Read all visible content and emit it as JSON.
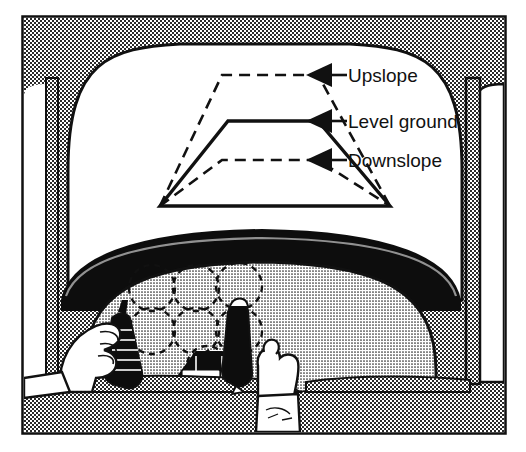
{
  "figure": {
    "frame_color": "#111111",
    "interior_fill_color": "#b4b4b4",
    "windshield_color": "#ffffff",
    "line_color": "#111111"
  },
  "callouts": [
    {
      "id": "upslope",
      "label": "Upslope",
      "style": "dashed",
      "arrow": "left-triangle",
      "arrow_x": 318,
      "arrow_y": 75,
      "text_x": 348,
      "text_y": 82,
      "leader_from_x": 328,
      "leader_to_x": 345
    },
    {
      "id": "level-ground",
      "label": "Level ground",
      "style": "solid",
      "arrow": "left-triangle",
      "arrow_x": 318,
      "arrow_y": 121,
      "text_x": 348,
      "text_y": 128,
      "leader_from_x": 328,
      "leader_to_x": 345
    },
    {
      "id": "downslope",
      "label": "Downslope",
      "style": "dashed",
      "arrow": "left-triangle",
      "arrow_x": 318,
      "arrow_y": 160,
      "text_x": 348,
      "text_y": 167,
      "leader_from_x": 328,
      "leader_to_x": 345
    }
  ],
  "trapezoids": {
    "base_left_x": 160,
    "base_right_x": 390,
    "base_y": 206,
    "upslope": {
      "top_left_x": 222,
      "top_right_x": 318,
      "top_y": 75,
      "style": "dashed"
    },
    "level": {
      "top_left_x": 228,
      "top_right_x": 318,
      "top_y": 121,
      "style": "solid"
    },
    "downslope": {
      "top_left_x": 222,
      "top_right_x": 318,
      "top_y": 160,
      "style": "dashed"
    }
  },
  "instrument_panel": {
    "gauge_outline_style": "dashed-circle",
    "gauge_count": 7,
    "gauges": [
      {
        "cx": 152,
        "cy": 288,
        "r": 23
      },
      {
        "cx": 196,
        "cy": 288,
        "r": 23
      },
      {
        "cx": 239,
        "cy": 286,
        "r": 23
      },
      {
        "cx": 152,
        "cy": 331,
        "r": 23
      },
      {
        "cx": 196,
        "cy": 331,
        "r": 23
      },
      {
        "cx": 239,
        "cy": 331,
        "r": 23
      },
      {
        "cx": 207,
        "cy": 366,
        "r": 20
      }
    ]
  },
  "controls": [
    {
      "id": "collective-lever",
      "hand": "left",
      "color": "#111111"
    },
    {
      "id": "cyclic-stick",
      "hand": "right",
      "color": "#111111"
    }
  ]
}
